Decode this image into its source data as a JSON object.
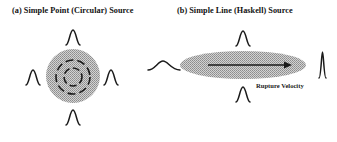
{
  "panels": {
    "a": {
      "title": "(a)  Simple Point (Circular) Source",
      "shape": "shaded circle with concentric dashed rings",
      "pulses": [
        "top",
        "bottom",
        "left",
        "right"
      ],
      "pulse_shape": "narrow symmetric"
    },
    "b": {
      "title": "(b)  Simple Line (Haskell) Source",
      "shape": "shaded ellipse with rightward arrow",
      "arrow_label": "Rupture Velocity",
      "pulses": [
        "back (wide, low)",
        "top",
        "bottom",
        "front (tall, narrow)"
      ]
    }
  },
  "colors": {
    "ink": "#1a1a1a",
    "fill": "#b8b8b8",
    "background": "#ffffff"
  }
}
